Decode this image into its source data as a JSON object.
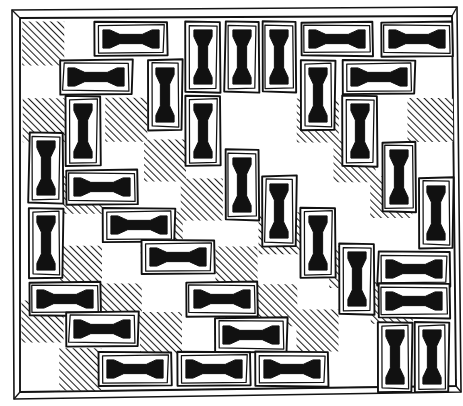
{
  "figure": {
    "caption": "",
    "background_color": "#ffffff",
    "ink_color": "#111111",
    "hatch_color": "#2b2b2b",
    "tile_fill": "#ffffff",
    "board": {
      "columns": 11,
      "rows": 10,
      "cell_width": 37.5,
      "cell_height": 36.2,
      "origin_x": 23,
      "origin_y": 22,
      "pattern": "checkerboard",
      "dark_square_style": "diagonal-hatch-45",
      "frame_style": "3d-beveled-slab",
      "frame_depth": 9
    },
    "domino_glyph": {
      "name": "i-beam",
      "description": "solid I-beam / dumbbell mark drawn inside every domino, aligned with the domino's long axis"
    },
    "dominoes": [
      {
        "id": 1,
        "orientation": "horizontal",
        "x": 95,
        "y": 22,
        "w": 72,
        "h": 34
      },
      {
        "id": 2,
        "orientation": "vertical",
        "x": 186,
        "y": 22,
        "w": 34,
        "h": 70
      },
      {
        "id": 3,
        "orientation": "vertical",
        "x": 225,
        "y": 22,
        "w": 34,
        "h": 70
      },
      {
        "id": 4,
        "orientation": "vertical",
        "x": 262,
        "y": 22,
        "w": 34,
        "h": 70
      },
      {
        "id": 5,
        "orientation": "horizontal",
        "x": 301,
        "y": 22,
        "w": 72,
        "h": 34
      },
      {
        "id": 6,
        "orientation": "horizontal",
        "x": 381,
        "y": 22,
        "w": 72,
        "h": 34
      },
      {
        "id": 7,
        "orientation": "horizontal",
        "x": 60,
        "y": 60,
        "w": 72,
        "h": 34
      },
      {
        "id": 8,
        "orientation": "vertical",
        "x": 148,
        "y": 60,
        "w": 34,
        "h": 70
      },
      {
        "id": 9,
        "orientation": "vertical",
        "x": 301,
        "y": 60,
        "w": 34,
        "h": 70
      },
      {
        "id": 10,
        "orientation": "horizontal",
        "x": 343,
        "y": 60,
        "w": 72,
        "h": 34
      },
      {
        "id": 11,
        "orientation": "vertical",
        "x": 66,
        "y": 96,
        "w": 34,
        "h": 70
      },
      {
        "id": 12,
        "orientation": "vertical",
        "x": 186,
        "y": 96,
        "w": 34,
        "h": 70
      },
      {
        "id": 13,
        "orientation": "vertical",
        "x": 343,
        "y": 96,
        "w": 34,
        "h": 70
      },
      {
        "id": 14,
        "orientation": "vertical",
        "x": 29,
        "y": 133,
        "w": 34,
        "h": 70
      },
      {
        "id": 15,
        "orientation": "vertical",
        "x": 225,
        "y": 150,
        "w": 34,
        "h": 70
      },
      {
        "id": 16,
        "orientation": "vertical",
        "x": 382,
        "y": 142,
        "w": 34,
        "h": 70
      },
      {
        "id": 17,
        "orientation": "horizontal",
        "x": 66,
        "y": 170,
        "w": 72,
        "h": 34
      },
      {
        "id": 18,
        "orientation": "vertical",
        "x": 262,
        "y": 176,
        "w": 34,
        "h": 70
      },
      {
        "id": 19,
        "orientation": "vertical",
        "x": 419,
        "y": 178,
        "w": 34,
        "h": 70
      },
      {
        "id": 20,
        "orientation": "vertical",
        "x": 29,
        "y": 208,
        "w": 34,
        "h": 70
      },
      {
        "id": 21,
        "orientation": "horizontal",
        "x": 103,
        "y": 208,
        "w": 72,
        "h": 34
      },
      {
        "id": 22,
        "orientation": "horizontal",
        "x": 142,
        "y": 240,
        "w": 72,
        "h": 34
      },
      {
        "id": 23,
        "orientation": "vertical",
        "x": 301,
        "y": 208,
        "w": 34,
        "h": 70
      },
      {
        "id": 24,
        "orientation": "vertical",
        "x": 340,
        "y": 244,
        "w": 34,
        "h": 70
      },
      {
        "id": 25,
        "orientation": "horizontal",
        "x": 378,
        "y": 252,
        "w": 72,
        "h": 34
      },
      {
        "id": 26,
        "orientation": "horizontal",
        "x": 378,
        "y": 284,
        "w": 72,
        "h": 34
      },
      {
        "id": 27,
        "orientation": "horizontal",
        "x": 29,
        "y": 282,
        "w": 72,
        "h": 34
      },
      {
        "id": 28,
        "orientation": "horizontal",
        "x": 186,
        "y": 282,
        "w": 72,
        "h": 34
      },
      {
        "id": 29,
        "orientation": "horizontal",
        "x": 66,
        "y": 312,
        "w": 72,
        "h": 34
      },
      {
        "id": 30,
        "orientation": "horizontal",
        "x": 215,
        "y": 318,
        "w": 72,
        "h": 34
      },
      {
        "id": 31,
        "orientation": "vertical",
        "x": 378,
        "y": 322,
        "w": 34,
        "h": 70
      },
      {
        "id": 32,
        "orientation": "vertical",
        "x": 415,
        "y": 322,
        "w": 34,
        "h": 70
      },
      {
        "id": 33,
        "orientation": "horizontal",
        "x": 99,
        "y": 352,
        "w": 72,
        "h": 34
      },
      {
        "id": 34,
        "orientation": "horizontal",
        "x": 178,
        "y": 352,
        "w": 72,
        "h": 34
      },
      {
        "id": 35,
        "orientation": "horizontal",
        "x": 256,
        "y": 352,
        "w": 72,
        "h": 34
      }
    ],
    "hatched_squares": [
      {
        "x": 23,
        "y": 22,
        "w": 42,
        "h": 44
      },
      {
        "x": 23,
        "y": 98,
        "w": 42,
        "h": 44
      },
      {
        "x": 105,
        "y": 98,
        "w": 42,
        "h": 44
      },
      {
        "x": 296,
        "y": 98,
        "w": 42,
        "h": 44
      },
      {
        "x": 408,
        "y": 98,
        "w": 46,
        "h": 44
      },
      {
        "x": 144,
        "y": 140,
        "w": 42,
        "h": 42
      },
      {
        "x": 333,
        "y": 140,
        "w": 42,
        "h": 42
      },
      {
        "x": 63,
        "y": 172,
        "w": 42,
        "h": 42
      },
      {
        "x": 181,
        "y": 178,
        "w": 42,
        "h": 42
      },
      {
        "x": 370,
        "y": 176,
        "w": 42,
        "h": 42
      },
      {
        "x": 140,
        "y": 212,
        "w": 42,
        "h": 42
      },
      {
        "x": 259,
        "y": 212,
        "w": 42,
        "h": 42
      },
      {
        "x": 60,
        "y": 246,
        "w": 42,
        "h": 42
      },
      {
        "x": 215,
        "y": 246,
        "w": 42,
        "h": 42
      },
      {
        "x": 330,
        "y": 246,
        "w": 42,
        "h": 42
      },
      {
        "x": 100,
        "y": 284,
        "w": 42,
        "h": 42
      },
      {
        "x": 255,
        "y": 284,
        "w": 42,
        "h": 42
      },
      {
        "x": 370,
        "y": 282,
        "w": 42,
        "h": 42
      },
      {
        "x": 22,
        "y": 300,
        "w": 42,
        "h": 42
      },
      {
        "x": 140,
        "y": 312,
        "w": 42,
        "h": 42
      },
      {
        "x": 296,
        "y": 310,
        "w": 42,
        "h": 42
      },
      {
        "x": 60,
        "y": 348,
        "w": 42,
        "h": 42
      },
      {
        "x": 215,
        "y": 308,
        "w": 42,
        "h": 42
      },
      {
        "x": 186,
        "y": 60,
        "w": 0,
        "h": 0
      }
    ]
  }
}
